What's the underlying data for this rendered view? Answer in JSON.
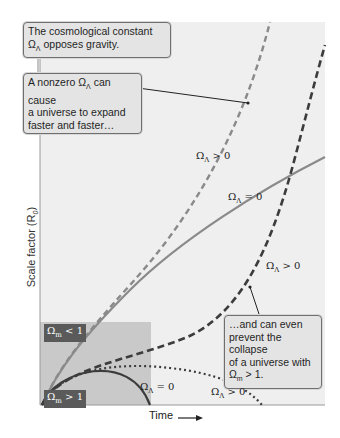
{
  "figure": {
    "y_axis_label": "Scale factor (R",
    "y_axis_label_sub": "0",
    "y_axis_label_end": ")",
    "x_axis_label": "Time",
    "colors": {
      "plot_bg": "#efefef",
      "shade": "#c9c9c9",
      "light_curve": "#8a8a8a",
      "dark_curve": "#3c3c3c",
      "tag_bg": "#5a5a5a"
    }
  },
  "callouts": {
    "top": {
      "line1": "The cosmological constant",
      "omega": "Ω",
      "sub": "Λ",
      "rest": " opposes gravity."
    },
    "middle": {
      "pre": "A nonzero ",
      "omega": "Ω",
      "sub": "Λ",
      "line1_rest": " can cause",
      "line2": "a universe to expand",
      "line3": "faster and faster…"
    },
    "bottom": {
      "line1": "…and can even",
      "line2": "prevent the collapse",
      "line3": "of a universe with",
      "omega": "Ω",
      "sub": "m",
      "rest": " > 1."
    }
  },
  "curve_labels": [
    {
      "omega": "Ω",
      "sub": "Λ",
      "rel": " > 0"
    },
    {
      "omega": "Ω",
      "sub": "Λ",
      "rel": " = 0"
    },
    {
      "omega": "Ω",
      "sub": "Λ",
      "rel": " > 0"
    },
    {
      "omega": "Ω",
      "sub": "Λ",
      "rel": " = 0"
    },
    {
      "omega": "Ω",
      "sub": "Λ",
      "rel": " > 0"
    }
  ],
  "region_tags": {
    "open": {
      "omega": "Ω",
      "sub": "m",
      "rel": " < 1"
    },
    "closed": {
      "omega": "Ω",
      "sub": "m",
      "rel": " > 1"
    }
  }
}
